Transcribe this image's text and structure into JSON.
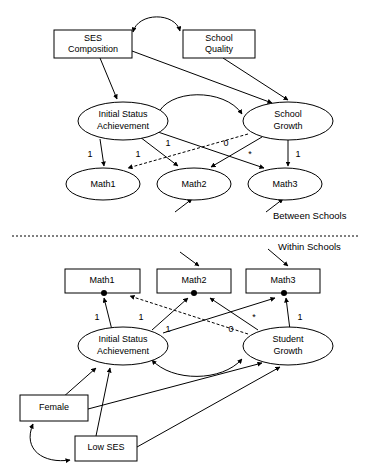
{
  "figure": {
    "levels": [
      {
        "id": "between",
        "label": "Between Schools"
      },
      {
        "id": "within",
        "label": "Within Schools"
      }
    ]
  },
  "between": {
    "section_label": "Between Schools",
    "observed": [
      {
        "id": "b-ses",
        "label_line1": "SES",
        "label_line2": "Composition",
        "shape": "rect"
      },
      {
        "id": "b-quality",
        "label_line1": "School",
        "label_line2": "Quality",
        "shape": "rect"
      }
    ],
    "latent": [
      {
        "id": "b-initial",
        "label_line1": "Initial Status",
        "label_line2": "Achievement",
        "shape": "ellipse"
      },
      {
        "id": "b-growth",
        "label_line1": "School",
        "label_line2": "Growth",
        "shape": "ellipse"
      }
    ],
    "indicators": [
      {
        "id": "b-math1",
        "label": "Math1",
        "shape": "ellipse"
      },
      {
        "id": "b-math2",
        "label": "Math2",
        "shape": "ellipse"
      },
      {
        "id": "b-math3",
        "label": "Math3",
        "shape": "ellipse"
      }
    ],
    "loadings": [
      {
        "id": "b-l1",
        "from": "b-initial",
        "to": "b-math1",
        "value": "1"
      },
      {
        "id": "b-l2",
        "from": "b-initial",
        "to": "b-math2",
        "value": "1"
      },
      {
        "id": "b-l3",
        "from": "b-initial",
        "to": "b-math3",
        "value": "1"
      },
      {
        "id": "b-l4",
        "from": "b-growth",
        "to": "b-math1",
        "value": "0",
        "style": "dashed"
      },
      {
        "id": "b-l5",
        "from": "b-growth",
        "to": "b-math2",
        "value": "*"
      },
      {
        "id": "b-l6",
        "from": "b-growth",
        "to": "b-math3",
        "value": "1"
      }
    ],
    "covariances": [
      {
        "id": "b-cov-exog",
        "between": [
          "b-ses",
          "b-quality"
        ],
        "style": "double-headed-curve"
      },
      {
        "id": "b-cov-latent",
        "between": [
          "b-initial",
          "b-growth"
        ],
        "style": "double-headed-curve"
      }
    ],
    "regressions": [
      {
        "id": "b-r1",
        "from": "b-ses",
        "to": "b-initial"
      },
      {
        "id": "b-r2",
        "from": "b-ses",
        "to": "b-growth"
      },
      {
        "id": "b-r3",
        "from": "b-quality",
        "to": "b-growth"
      }
    ],
    "disturbances": [
      {
        "id": "b-d-math2",
        "target": "b-math2"
      },
      {
        "id": "b-d-math3",
        "target": "b-math3"
      }
    ]
  },
  "within": {
    "section_label": "Within Schools",
    "indicators": [
      {
        "id": "w-math1",
        "label": "Math1",
        "shape": "rect"
      },
      {
        "id": "w-math2",
        "label": "Math2",
        "shape": "rect"
      },
      {
        "id": "w-math3",
        "label": "Math3",
        "shape": "rect"
      }
    ],
    "latent": [
      {
        "id": "w-initial",
        "label_line1": "Initial Status",
        "label_line2": "Achievement",
        "shape": "ellipse"
      },
      {
        "id": "w-growth",
        "label_line1": "Student",
        "label_line2": "Growth",
        "shape": "ellipse"
      }
    ],
    "observed": [
      {
        "id": "w-female",
        "label": "Female",
        "shape": "rect"
      },
      {
        "id": "w-lowses",
        "label": "Low SES",
        "shape": "rect"
      }
    ],
    "loadings": [
      {
        "id": "w-l1",
        "from": "w-initial",
        "to": "w-math1",
        "value": "1"
      },
      {
        "id": "w-l2",
        "from": "w-initial",
        "to": "w-math2",
        "value": "1"
      },
      {
        "id": "w-l3",
        "from": "w-initial",
        "to": "w-math3",
        "value": "1"
      },
      {
        "id": "w-l4",
        "from": "w-growth",
        "to": "w-math1",
        "value": "0",
        "style": "dashed"
      },
      {
        "id": "w-l5",
        "from": "w-growth",
        "to": "w-math2",
        "value": "*"
      },
      {
        "id": "w-l6",
        "from": "w-growth",
        "to": "w-math3",
        "value": "1"
      }
    ],
    "covariances": [
      {
        "id": "w-cov-latent",
        "between": [
          "w-initial",
          "w-growth"
        ],
        "style": "double-headed-curve"
      },
      {
        "id": "w-cov-exog",
        "between": [
          "w-female",
          "w-lowses"
        ],
        "style": "double-headed-curve"
      }
    ],
    "regressions": [
      {
        "id": "w-r1",
        "from": "w-female",
        "to": "w-initial"
      },
      {
        "id": "w-r2",
        "from": "w-lowses",
        "to": "w-initial"
      },
      {
        "id": "w-r3",
        "from": "w-female",
        "to": "w-growth"
      },
      {
        "id": "w-r4",
        "from": "w-lowses",
        "to": "w-growth"
      }
    ],
    "disturbances": [
      {
        "id": "w-d-math2",
        "target": "w-math2"
      },
      {
        "id": "w-d-math3",
        "target": "w-math3"
      }
    ],
    "residual_dots": [
      {
        "id": "w-res-math1",
        "target": "w-math1"
      },
      {
        "id": "w-res-math2",
        "target": "w-math2"
      },
      {
        "id": "w-res-math3",
        "target": "w-math3"
      }
    ]
  },
  "colors": {
    "stroke": "#000000",
    "fill": "#ffffff",
    "text": "#000000"
  }
}
